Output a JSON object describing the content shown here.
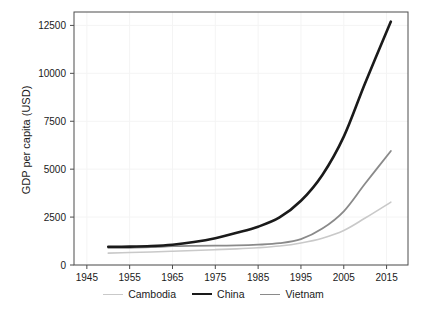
{
  "chart_data": {
    "type": "line",
    "title": "",
    "xlabel": "",
    "ylabel": "GDP per capita (USD)",
    "xlim": [
      1942,
      2020
    ],
    "ylim": [
      0,
      13200
    ],
    "xticks": [
      1945,
      1955,
      1965,
      1975,
      1985,
      1995,
      2005,
      2015
    ],
    "yticks": [
      0,
      2500,
      5000,
      7500,
      10000,
      12500
    ],
    "ytick_labels": [
      "0",
      "2500",
      "5000",
      "7500",
      "10000",
      "12500"
    ],
    "xtick_labels": [
      "1945",
      "1955",
      "1965",
      "1975",
      "1985",
      "1995",
      "2005",
      "2015"
    ],
    "grid": true,
    "legend_position": "bottom",
    "x": [
      1950,
      1955,
      1960,
      1965,
      1970,
      1975,
      1980,
      1985,
      1990,
      1995,
      2000,
      2005,
      2010,
      2016
    ],
    "series": [
      {
        "name": "Cambodia",
        "color": "#c9c9c9",
        "width": 1.6,
        "values": [
          620,
          650,
          680,
          720,
          760,
          800,
          840,
          900,
          990,
          1150,
          1400,
          1800,
          2450,
          3280
        ]
      },
      {
        "name": "China",
        "color": "#1a1a1a",
        "width": 2.6,
        "values": [
          950,
          960,
          990,
          1060,
          1200,
          1400,
          1680,
          2000,
          2480,
          3350,
          4700,
          6700,
          9500,
          12700
        ]
      },
      {
        "name": "Vietnam",
        "color": "#8a8a8a",
        "width": 1.8,
        "values": [
          900,
          900,
          930,
          980,
          1000,
          1010,
          1020,
          1060,
          1140,
          1350,
          1900,
          2800,
          4250,
          5950
        ]
      }
    ]
  },
  "legend": {
    "items": [
      {
        "label": "Cambodia",
        "color": "#c9c9c9",
        "width": 1.6
      },
      {
        "label": "China",
        "color": "#1a1a1a",
        "width": 2.6
      },
      {
        "label": "Vietnam",
        "color": "#8a8a8a",
        "width": 1.8
      }
    ]
  },
  "colors": {
    "background": "#ffffff",
    "axis": "#4d4d4d",
    "grid": "#f4f4f4",
    "text": "#1a1a1a"
  }
}
